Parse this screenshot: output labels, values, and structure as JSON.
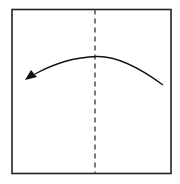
{
  "diagram": {
    "type": "origami-fold-instruction",
    "paper": {
      "shape": "square",
      "stroke": "#222222"
    },
    "fold_line": {
      "style": "dashed",
      "orientation": "vertical",
      "position": "center",
      "color": "#444444"
    },
    "arrow": {
      "direction": "right-to-left",
      "meaning": "fold right half over to the left along the valley line",
      "color": "#111111"
    }
  }
}
